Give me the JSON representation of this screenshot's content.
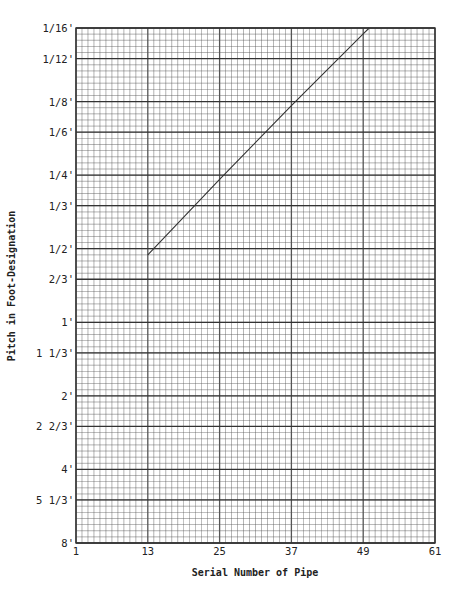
{
  "chart_data": {
    "type": "line",
    "title": "",
    "xlabel": "Serial Number of Pipe",
    "ylabel": "Pitch in Foot-Designation",
    "x_ticks": [
      1,
      13,
      25,
      37,
      49,
      61
    ],
    "xlim": [
      1,
      61
    ],
    "y_ticks": [
      "1/16'",
      "1/12'",
      "1/8'",
      "1/6'",
      "1/4'",
      "1/3'",
      "1/2'",
      "2/3'",
      "1'",
      "1 1/3'",
      "2'",
      "2 2/3'",
      "4'",
      "5 1/3'",
      "8'"
    ],
    "y_tick_feet": [
      0.0625,
      0.08333,
      0.125,
      0.16667,
      0.25,
      0.33333,
      0.5,
      0.66667,
      1,
      1.33333,
      2,
      2.66667,
      4,
      5.33333,
      8
    ],
    "y_scale": "log2 (inverted: 8' at bottom, 1/16' at top)",
    "ylim_feet": [
      8,
      0.0625
    ],
    "grid": true,
    "grid_minor_columns": 60,
    "grid_minor_rows": 84,
    "series": [
      {
        "name": "pipe pitch line",
        "x": [
          13,
          25,
          37,
          49,
          50
        ],
        "y_feet": [
          0.53,
          0.26,
          0.13,
          0.066,
          0.0625
        ]
      }
    ]
  },
  "plot": {
    "left": 76,
    "top": 28,
    "right": 435,
    "bottom": 543,
    "line_color": "#333333",
    "grid_color": "#555555"
  }
}
